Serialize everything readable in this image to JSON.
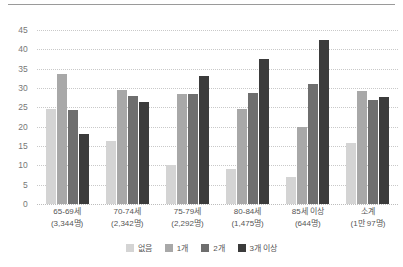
{
  "chart_data": {
    "type": "bar",
    "title": "",
    "subtitle": "",
    "xlabel": "",
    "ylabel": "",
    "ylim": [
      0,
      45
    ],
    "ytick_step": 5,
    "yticks": [
      45,
      40,
      35,
      30,
      25,
      20,
      15,
      10,
      5,
      0
    ],
    "grid": true,
    "legend_position": "bottom",
    "categories": [
      "65-69세\n(3,344명)",
      "70-74세\n(2,342명)",
      "75-79세\n(2,292명)",
      "80-84세\n(1,475명)",
      "85세 이상\n(644명)",
      "소계\n(1만 97명)"
    ],
    "category_lines": [
      {
        "line1": "65-69세",
        "line2": "(3,344명)"
      },
      {
        "line1": "70-74세",
        "line2": "(2,342명)"
      },
      {
        "line1": "75-79세",
        "line2": "(2,292명)"
      },
      {
        "line1": "80-84세",
        "line2": "(1,475명)"
      },
      {
        "line1": "85세 이상",
        "line2": "(644명)"
      },
      {
        "line1": "소계",
        "line2": "(1만 97명)"
      }
    ],
    "series": [
      {
        "name": "없음",
        "color": "#d4d4d4",
        "values": [
          24.5,
          16.2,
          10.2,
          9.0,
          7.0,
          15.8
        ]
      },
      {
        "name": "1개",
        "color": "#a8a8a8",
        "values": [
          33.5,
          29.5,
          28.4,
          24.5,
          19.8,
          29.3
        ]
      },
      {
        "name": "2개",
        "color": "#6e6e6e",
        "values": [
          24.3,
          28.0,
          28.4,
          28.6,
          31.0,
          27.0
        ]
      },
      {
        "name": "3개 이상",
        "color": "#3b3b3b",
        "values": [
          18.0,
          26.5,
          33.0,
          37.5,
          42.3,
          27.8
        ]
      }
    ]
  },
  "colors": {
    "background": "#ffffff",
    "gridline": "#c9c9c9",
    "axis_text": "#777777",
    "category_text": "#555555",
    "top_rule": "#9a9a9a"
  }
}
